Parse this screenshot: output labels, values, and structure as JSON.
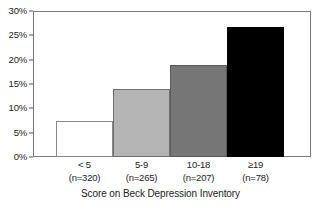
{
  "chart_data": {
    "type": "bar",
    "title": "",
    "xlabel": "Score on Beck Depression Inventory",
    "ylabel": "",
    "categories": [
      "< 5",
      "5-9",
      "10-18",
      "≥19"
    ],
    "category_counts": [
      "(n=320)",
      "(n=265)",
      "(n=207)",
      "(n=78)"
    ],
    "values": [
      7.5,
      14,
      19,
      27
    ],
    "value_unit": "%",
    "ylim": [
      0,
      30
    ],
    "ytick_values": [
      0,
      5,
      10,
      15,
      20,
      25,
      30
    ],
    "ytick_labels": [
      "0%",
      "5%",
      "10%",
      "15%",
      "20%",
      "25%",
      "30%"
    ],
    "grid": false,
    "legend": "none",
    "bar_colors": [
      "#ffffff",
      "#b4b4b4",
      "#767676",
      "#000000"
    ],
    "bar_edge_color": "#555555",
    "axis_color": "#777777"
  }
}
